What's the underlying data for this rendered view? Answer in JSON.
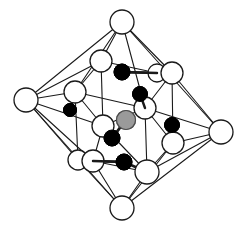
{
  "figure": {
    "title": "",
    "caption": "",
    "background": "#ffffff",
    "line_color": "#1a1a1a",
    "atom_styles": {
      "white": {
        "fill": "#ffffff",
        "stroke": "#1a1a1a",
        "stroke_width": 1.3
      },
      "black": {
        "fill": "#000000",
        "stroke": "#000000",
        "stroke_width": 1
      },
      "gray": {
        "fill": "#9a9a9a",
        "stroke": "#4d4d4d",
        "stroke_width": 1.2
      }
    }
  },
  "chart_data": {
    "type": "diagram",
    "apex_vertices": [
      {
        "id": "apex-top",
        "x": 122,
        "y": 22,
        "r": 12,
        "type": "white"
      },
      {
        "id": "apex-left",
        "x": 26,
        "y": 100,
        "r": 12,
        "type": "white"
      },
      {
        "id": "apex-right",
        "x": 221,
        "y": 132,
        "r": 12,
        "type": "white"
      },
      {
        "id": "apex-bottom",
        "x": 122,
        "y": 208,
        "r": 12,
        "type": "white"
      }
    ],
    "cage_vertices": [
      {
        "id": "cage-back-top",
        "x": 101,
        "y": 61,
        "r": 11,
        "type": "white"
      },
      {
        "id": "cage-right-top-a",
        "x": 157,
        "y": 73,
        "r": 9,
        "type": "white"
      },
      {
        "id": "cage-right-top-b",
        "x": 172,
        "y": 73,
        "r": 11,
        "type": "white"
      },
      {
        "id": "cage-left-upper",
        "x": 75,
        "y": 92,
        "r": 11,
        "type": "white"
      },
      {
        "id": "cage-mid-right",
        "x": 145,
        "y": 108,
        "r": 11,
        "type": "white"
      },
      {
        "id": "cage-mid-left",
        "x": 103,
        "y": 126,
        "r": 11,
        "type": "white"
      },
      {
        "id": "cage-right-lower",
        "x": 173,
        "y": 143,
        "r": 11,
        "type": "white"
      },
      {
        "id": "cage-left-low-a",
        "x": 78,
        "y": 160,
        "r": 10,
        "type": "white"
      },
      {
        "id": "cage-left-low-b",
        "x": 93,
        "y": 161,
        "r": 11,
        "type": "white"
      },
      {
        "id": "cage-bottom-front",
        "x": 147,
        "y": 172,
        "r": 12,
        "type": "white"
      }
    ],
    "interior_atoms": [
      {
        "id": "black-top",
        "x": 122,
        "y": 72,
        "r": 8,
        "type": "black"
      },
      {
        "id": "black-upper-right",
        "x": 140,
        "y": 94,
        "r": 7.5,
        "type": "black"
      },
      {
        "id": "black-left",
        "x": 70,
        "y": 110,
        "r": 6.5,
        "type": "black"
      },
      {
        "id": "black-right",
        "x": 172,
        "y": 125,
        "r": 7.5,
        "type": "black"
      },
      {
        "id": "black-center-left",
        "x": 112,
        "y": 138,
        "r": 8,
        "type": "black"
      },
      {
        "id": "black-bottom",
        "x": 124,
        "y": 162,
        "r": 8,
        "type": "black"
      },
      {
        "id": "gray-center",
        "x": 126,
        "y": 120,
        "r": 9.5,
        "type": "gray"
      }
    ],
    "edges_octahedron": [
      [
        "apex-top",
        "apex-left"
      ],
      [
        "apex-top",
        "apex-right"
      ],
      [
        "apex-bottom",
        "apex-left"
      ],
      [
        "apex-bottom",
        "apex-right"
      ]
    ],
    "edge_count": 36,
    "legend": []
  }
}
